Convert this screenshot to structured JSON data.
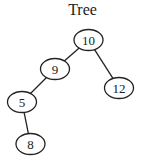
{
  "diagram": {
    "title": "Tree",
    "type": "binary-tree",
    "nodes": [
      {
        "id": "n10",
        "label": "10",
        "cx": 88.5,
        "cy": 40,
        "rx": 14.5,
        "ry": 10.5
      },
      {
        "id": "n9",
        "label": "9",
        "cx": 55,
        "cy": 69,
        "rx": 14.5,
        "ry": 10.5
      },
      {
        "id": "n12",
        "label": "12",
        "cx": 119,
        "cy": 88,
        "rx": 14.5,
        "ry": 10.5
      },
      {
        "id": "n5",
        "label": "5",
        "cx": 22,
        "cy": 102,
        "rx": 14.5,
        "ry": 10.5
      },
      {
        "id": "n8",
        "label": "8",
        "cx": 30.5,
        "cy": 144,
        "rx": 14.5,
        "ry": 10.5
      }
    ],
    "edges": [
      {
        "from": "n10",
        "to": "n9"
      },
      {
        "from": "n10",
        "to": "n12"
      },
      {
        "from": "n9",
        "to": "n5"
      },
      {
        "from": "n5",
        "to": "n8"
      }
    ],
    "colors": {
      "stroke": "#222222",
      "fill": "#ffffff",
      "text": "#222222"
    }
  }
}
